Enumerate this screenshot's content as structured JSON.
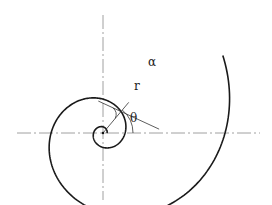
{
  "diagram": {
    "center": {
      "x": 103,
      "y": 133
    },
    "axes": {
      "horizontal": {
        "x1": 17,
        "x2": 260,
        "y": 133
      },
      "vertical": {
        "x": 103,
        "y1": 15,
        "y2": 200
      }
    },
    "spiral": {
      "a": 4.0,
      "b": 0.272,
      "theta_start": 0.0,
      "theta_end": 13.15,
      "stroke": "#1a1a1a"
    },
    "radius_line": {
      "angle_deg": 50
    },
    "labels": {
      "alpha": "α",
      "r": "r",
      "theta": "θ"
    }
  }
}
